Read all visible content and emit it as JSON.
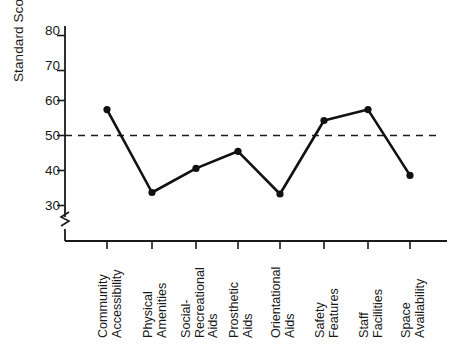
{
  "chart_data": {
    "type": "line",
    "title": "",
    "xlabel": "",
    "ylabel": "Standard Score",
    "categories": [
      "Community Accessibility",
      "Physical Amenities",
      "Social-Recreational Aids",
      "Prosthetic Aids",
      "Orientational Aids",
      "Safety Features",
      "Staff Facilities",
      "Space Availability"
    ],
    "category_lines": [
      [
        "Community",
        "Accessibility"
      ],
      [
        "Physical",
        "Amenities"
      ],
      [
        "Social-",
        "Recreational",
        "Aids"
      ],
      [
        "Prosthetic",
        "Aids"
      ],
      [
        "Orientational",
        "Aids"
      ],
      [
        "Safety",
        "Features"
      ],
      [
        "Staff",
        "Facilities"
      ],
      [
        "Space",
        "Availability"
      ]
    ],
    "values": [
      57.4,
      33.7,
      40.6,
      45.5,
      33.3,
      54.3,
      57.4,
      38.6
    ],
    "ylim": [
      26,
      84
    ],
    "yticks": [
      30,
      40,
      50,
      60,
      70,
      80
    ],
    "ytick_labels": [
      "30",
      "40",
      "50",
      "60",
      "70",
      "80"
    ],
    "grid": false,
    "legend": "none",
    "axis_break": true,
    "axis_break_note": "zig-zag break on y-axis below 30",
    "reference_line": {
      "value": 50,
      "style": "dashed",
      "label": ""
    },
    "series_color": "#111111",
    "marker": "filled-circle"
  }
}
